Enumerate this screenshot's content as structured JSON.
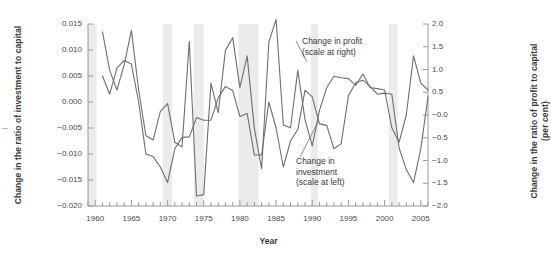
{
  "axes": {
    "left_title": "Change in the ratio of investment to capital",
    "right_title": "Change in the ratio of profit to capital\n(per cent)",
    "x_title": "Year",
    "left_ticks": [
      "0.015",
      "0.010",
      "0.005",
      "0.000",
      "−0.005",
      "−0.010",
      "−0.015",
      "−0.020"
    ],
    "right_ticks": [
      "2.0",
      "1.5",
      "1.0",
      "0.5",
      "−0.0",
      "−0.5",
      "−1.0",
      "−1.5",
      "−2.0"
    ],
    "x_ticks": [
      "1960",
      "1965",
      "1970",
      "1975",
      "1980",
      "1985",
      "1990",
      "1995",
      "2000",
      "2005"
    ]
  },
  "annotations": [
    {
      "name": "profit-annotation",
      "text": "Change in profit\n(scale at right)"
    },
    {
      "name": "investment-annotation",
      "text": "Change in\ninvestment\n(scale at left)"
    }
  ],
  "colors": {
    "line": "#6e6e6e",
    "axis": "#9a9a9a",
    "band": "#ebebeb",
    "text": "#3a3a3a",
    "background": "#ffffff"
  },
  "chart_data": {
    "type": "line",
    "title": "",
    "xlabel": "Year",
    "ylabel": "Change in the ratio of investment to capital",
    "ylabel_right": "Change in the ratio of profit to capital (per cent)",
    "xlim": [
      1959,
      2006
    ],
    "ylim": [
      -0.02,
      0.015
    ],
    "ylim_right": [
      -2.0,
      2.0
    ],
    "grid": false,
    "legend": "annotations-inline",
    "shaded_bands": [
      [
        1959.0,
        1960.2
      ],
      [
        1969.3,
        1970.6
      ],
      [
        1973.6,
        1975.0
      ],
      [
        1979.8,
        1982.6
      ],
      [
        1989.8,
        1990.8
      ],
      [
        2000.6,
        2001.8
      ]
    ],
    "x": [
      1961,
      1962,
      1963,
      1964,
      1965,
      1966,
      1967,
      1968,
      1969,
      1970,
      1971,
      1972,
      1973,
      1974,
      1975,
      1976,
      1977,
      1978,
      1979,
      1980,
      1981,
      1982,
      1983,
      1984,
      1985,
      1986,
      1987,
      1988,
      1989,
      1990,
      1991,
      1992,
      1993,
      1994,
      1995,
      1996,
      1997,
      1998,
      1999,
      2000,
      2001,
      2002,
      2003,
      2004,
      2005,
      2006
    ],
    "series": [
      {
        "name": "Change in investment (scale at left)",
        "axis": "left",
        "units": "ratio change",
        "values": [
          0.005,
          0.0015,
          0.0065,
          0.008,
          0.0073,
          0.0,
          -0.01,
          -0.0105,
          -0.0125,
          -0.0155,
          -0.009,
          -0.0068,
          -0.0067,
          -0.003,
          -0.0035,
          -0.0035,
          0.0008,
          0.003,
          0.0022,
          -0.0028,
          -0.0022,
          -0.0102,
          -0.0102,
          0.0,
          -0.005,
          -0.0125,
          -0.0075,
          -0.0053,
          0.0023,
          0.001,
          -0.0042,
          -0.0045,
          -0.009,
          -0.008,
          0.0012,
          0.0037,
          0.0042,
          0.003,
          0.0015,
          0.0017,
          0.0015,
          -0.0088,
          -0.013,
          -0.0155,
          -0.009,
          0.001
        ]
      },
      {
        "name": "Change in profit (scale at right)",
        "axis": "right",
        "units": "per cent",
        "values": [
          1.83,
          0.98,
          0.55,
          1.1,
          1.86,
          0.55,
          -0.45,
          -0.55,
          0.08,
          0.25,
          -0.6,
          -0.7,
          1.62,
          -1.78,
          -1.75,
          0.7,
          0.05,
          1.42,
          1.7,
          0.6,
          1.3,
          -0.3,
          -1.18,
          1.6,
          2.1,
          -0.22,
          -0.28,
          0.98,
          -0.1,
          -0.68,
          0.1,
          0.6,
          0.85,
          0.82,
          0.8,
          0.65,
          0.9,
          0.6,
          0.58,
          0.55,
          -0.28,
          -0.6,
          0.0,
          1.3,
          0.7,
          0.55
        ]
      }
    ]
  }
}
